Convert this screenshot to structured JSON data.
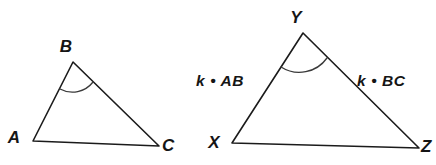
{
  "figure": {
    "background_color": "#ffffff",
    "stroke_color": "#1b1b1b",
    "arc_color": "#3a3a3a",
    "label_color": "#151515"
  },
  "triangle_left": {
    "name": "triangle-abc",
    "vertices": [
      {
        "id": "A",
        "label": "A",
        "x": 33,
        "y": 141,
        "label_x": 14,
        "label_y": 143
      },
      {
        "id": "B",
        "label": "B",
        "x": 73,
        "y": 62,
        "label_x": 66,
        "label_y": 52
      },
      {
        "id": "C",
        "label": "C",
        "x": 159,
        "y": 146,
        "label_x": 162,
        "label_y": 151
      }
    ],
    "path": "M 33 141 L 73 62 L 159 146 Z",
    "angle_arc": {
      "name": "angle-arc-b",
      "path": "M 60 89 A 26 26 0 0 0 93 82",
      "at_vertex": "B"
    }
  },
  "triangle_right": {
    "name": "triangle-xyz",
    "vertices": [
      {
        "id": "X",
        "label": "X",
        "x": 232,
        "y": 143,
        "label_x": 214,
        "label_y": 148
      },
      {
        "id": "Y",
        "label": "Y",
        "x": 303,
        "y": 33,
        "label_x": 296,
        "label_y": 23
      },
      {
        "id": "Z",
        "label": "Z",
        "x": 419,
        "y": 148,
        "label_x": 421,
        "label_y": 152
      }
    ],
    "path": "M 232 143 L 303 33 L 419 148 Z",
    "angle_arc": {
      "name": "angle-arc-y",
      "path": "M 281 67 A 34 34 0 0 0 327 58",
      "at_vertex": "Y"
    },
    "side_labels": [
      {
        "name": "side-label-xy",
        "text": "k • AB",
        "x": 196,
        "y": 86,
        "anchor": "start",
        "describes": "XY = k times AB"
      },
      {
        "name": "side-label-yz",
        "text": "k • BC",
        "x": 357,
        "y": 86,
        "anchor": "start",
        "describes": "YZ = k times BC"
      }
    ]
  }
}
